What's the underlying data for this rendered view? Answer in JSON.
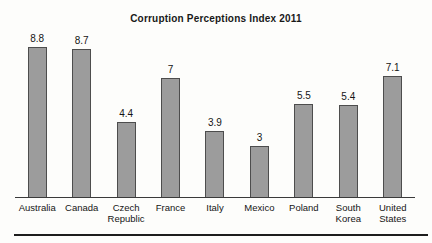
{
  "chart_data": {
    "type": "bar",
    "title": "Corruption Perceptions Index 2011",
    "categories": [
      "Australia",
      "Canada",
      "Czech Republic",
      "France",
      "Italy",
      "Mexico",
      "Poland",
      "South Korea",
      "United States"
    ],
    "categories_display": [
      [
        "Australia"
      ],
      [
        "Canada"
      ],
      [
        "Czech",
        "Republic"
      ],
      [
        "France"
      ],
      [
        "Italy"
      ],
      [
        "Mexico"
      ],
      [
        "Poland"
      ],
      [
        "South",
        "Korea"
      ],
      [
        "United",
        "States"
      ]
    ],
    "values": [
      8.8,
      8.7,
      4.4,
      7,
      3.9,
      3,
      5.5,
      5.4,
      7.1
    ],
    "value_labels": [
      "8.8",
      "8.7",
      "4.4",
      "7",
      "3.9",
      "3",
      "5.5",
      "5.4",
      "7.1"
    ],
    "xlabel": "",
    "ylabel": "",
    "ylim": [
      0,
      9.2
    ],
    "grid": false,
    "legend": null,
    "value_labels_shown": true,
    "bar_color": "#9c9c9c",
    "bar_border_color": "#4d4d4d",
    "axis_color": "#3a3a3a",
    "background_color": "#fdfdfb",
    "text_color": "#151515"
  }
}
